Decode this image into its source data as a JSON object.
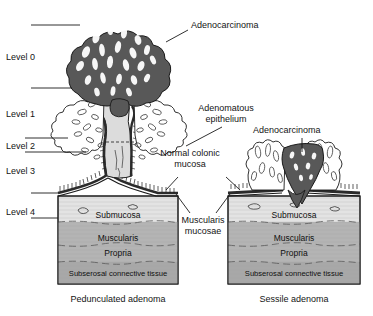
{
  "figure": {
    "background_color": "#ffffff",
    "ink_color": "#1a1a1a"
  },
  "levels": [
    {
      "id": "level-0",
      "label": "Level 0"
    },
    {
      "id": "level-1",
      "label": "Level 1"
    },
    {
      "id": "level-2",
      "label": "Level 2"
    },
    {
      "id": "level-3",
      "label": "Level 3"
    },
    {
      "id": "level-4",
      "label": "Level 4"
    }
  ],
  "annotations": {
    "adenocarcinoma_left": "Adenocarcinoma",
    "adenomatous_epithelium_line1": "Adenomatous",
    "adenomatous_epithelium_line2": "epithelium",
    "adenocarcinoma_right": "Adenocarcinoma",
    "normal_colonic_line1": "Normal colonic",
    "normal_colonic_line2": "mucosa",
    "muscularis_mucosae_line1": "Muscularis",
    "muscularis_mucosae_line2": "mucosae"
  },
  "layers": {
    "submucosa": "Submucosa",
    "muscularis": "Muscularis",
    "propria": "Propria",
    "subserosa": "Subserosal connective tissue"
  },
  "captions": {
    "left": "Pedunculated adenoma",
    "right": "Sessile adenoma"
  },
  "colors": {
    "carcinoma": "#585858",
    "submucosa": "#e3e3e3",
    "muscularis_propria": "#b4b4b4",
    "subserosa": "#a8a8a8",
    "stalk": "#dcdcdc",
    "outline": "#1a1a1a"
  }
}
